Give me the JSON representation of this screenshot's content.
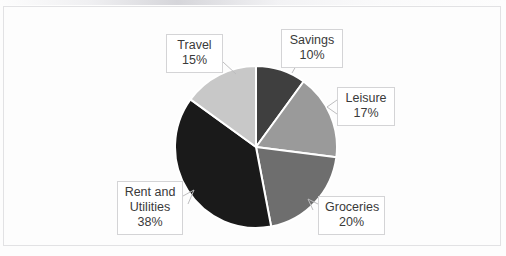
{
  "chart_data": {
    "type": "pie",
    "title": "",
    "start_angle_deg": 0,
    "direction": "clockwise",
    "legend": "none",
    "labels_inside": false,
    "categories": [
      "Savings",
      "Leisure",
      "Groceries",
      "Rent and Utilities",
      "Travel"
    ],
    "values": [
      10,
      17,
      20,
      38,
      15
    ],
    "unit": "%",
    "slices": [
      {
        "label": "Savings",
        "value": 10,
        "percent_text": "10%",
        "color": "#3f3f3f"
      },
      {
        "label": "Leisure",
        "value": 17,
        "percent_text": "17%",
        "color": "#9a9a9a"
      },
      {
        "label": "Groceries",
        "value": 20,
        "percent_text": "20%",
        "color": "#6e6e6e"
      },
      {
        "label": "Rent and Utilities",
        "value": 38,
        "percent_text": "38%",
        "color": "#1a1a1a"
      },
      {
        "label": "Travel",
        "value": 15,
        "percent_text": "15%",
        "color": "#c8c8c8"
      }
    ]
  },
  "callouts": {
    "travel": {
      "label": "Travel",
      "percent": "15%"
    },
    "savings": {
      "label": "Savings",
      "percent": "10%"
    },
    "leisure": {
      "label": "Leisure",
      "percent": "17%"
    },
    "groceries": {
      "label": "Groceries",
      "percent": "20%"
    },
    "rent": {
      "line1": "Rent and",
      "line2": "Utilities",
      "percent": "38%"
    }
  },
  "style": {
    "slice_separator_color": "#ffffff",
    "plot_border_color": "#e2e2e4",
    "background_color": "#fdfdfd",
    "label_text_color": "#3a3a3a",
    "label_border_color": "#d4d4d6"
  }
}
